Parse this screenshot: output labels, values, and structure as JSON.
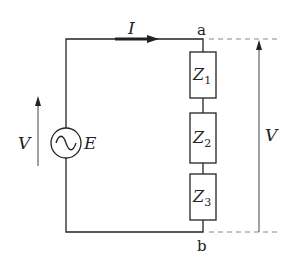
{
  "diagram": {
    "current_label": "I",
    "source": {
      "voltage_label": "V",
      "emf_label": "E",
      "symbol": "ac-source-icon"
    },
    "nodes": {
      "top": "a",
      "bottom": "b"
    },
    "impedances": [
      {
        "name": "Z",
        "sub": "1"
      },
      {
        "name": "Z",
        "sub": "2"
      },
      {
        "name": "Z",
        "sub": "3"
      }
    ],
    "terminal_voltage_label": "V",
    "colors": {
      "line": "#222222",
      "dashed": "#888888",
      "background": "#ffffff"
    }
  }
}
